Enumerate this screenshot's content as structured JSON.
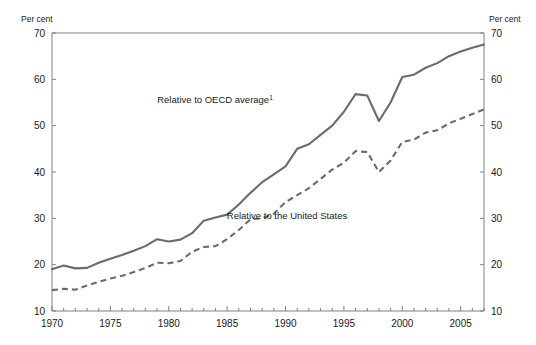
{
  "chart_data": {
    "type": "line",
    "title": "",
    "xlabel": "",
    "ylabel": "Per cent",
    "ylabel_right": "Per cent",
    "xlim": [
      1970,
      2007
    ],
    "ylim": [
      10,
      70
    ],
    "yticks": [
      10,
      20,
      30,
      40,
      50,
      60,
      70
    ],
    "xticks": [
      1970,
      1975,
      1980,
      1985,
      1990,
      1995,
      2000,
      2005
    ],
    "xtick_minor_step": 1,
    "grid": false,
    "legend_position": "inline-annotations",
    "line_color": "#6b6b6b",
    "axis_color": "#808080",
    "x": [
      1970,
      1971,
      1972,
      1973,
      1974,
      1975,
      1976,
      1977,
      1978,
      1979,
      1980,
      1981,
      1982,
      1983,
      1984,
      1985,
      1986,
      1987,
      1988,
      1989,
      1990,
      1991,
      1992,
      1993,
      1994,
      1995,
      1996,
      1997,
      1998,
      1999,
      2000,
      2001,
      2002,
      2003,
      2004,
      2005,
      2006,
      2007
    ],
    "series": [
      {
        "name": "Relative to OECD average",
        "style": "solid",
        "label": "Relative to OECD average",
        "label_superscript": "1",
        "values": [
          19.0,
          19.8,
          19.2,
          19.3,
          20.4,
          21.3,
          22.1,
          23.0,
          24.0,
          25.5,
          25.0,
          25.4,
          26.8,
          29.5,
          30.2,
          30.8,
          33.0,
          35.5,
          37.8,
          39.5,
          41.2,
          45.0,
          46.0,
          48.0,
          50.0,
          53.0,
          56.8,
          56.5,
          51.0,
          55.0,
          60.5,
          61.0,
          62.5,
          63.5,
          65.0,
          66.0,
          66.8,
          67.5
        ]
      },
      {
        "name": "Relative to the United States",
        "style": "dashed",
        "label": "Relative to the United States",
        "label_superscript": "",
        "values": [
          14.5,
          14.8,
          14.6,
          15.5,
          16.3,
          17.0,
          17.6,
          18.4,
          19.3,
          20.4,
          20.3,
          20.8,
          22.8,
          23.8,
          24.0,
          25.5,
          27.5,
          29.8,
          30.0,
          31.0,
          33.5,
          35.0,
          36.5,
          38.5,
          40.5,
          42.0,
          44.5,
          44.3,
          40.0,
          42.5,
          46.5,
          47.0,
          48.5,
          49.0,
          50.5,
          51.5,
          52.5,
          53.5
        ]
      }
    ],
    "annotations": [
      {
        "text": "Relative to OECD average",
        "superscript": "1",
        "x_px": 215,
        "y_px": 103,
        "name": "annotation-oecd"
      },
      {
        "text": "Relative to the United States",
        "superscript": "",
        "x_px": 287,
        "y_px": 219,
        "name": "annotation-us"
      }
    ]
  },
  "axes": {
    "left_unit": "Per cent",
    "right_unit": "Per cent",
    "ytick_labels": [
      "70",
      "60",
      "50",
      "40",
      "30",
      "20",
      "10"
    ],
    "xtick_labels": [
      "1970",
      "1975",
      "1980",
      "1985",
      "1990",
      "1995",
      "2000",
      "2005"
    ]
  }
}
